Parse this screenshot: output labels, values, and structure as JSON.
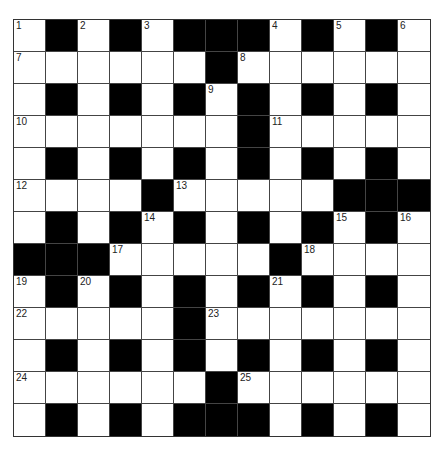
{
  "puzzle": {
    "rows": 13,
    "cols": 13,
    "colors": {
      "block": "#000000",
      "cell": "#ffffff",
      "line": "#444444"
    },
    "grid": [
      "W#W#W###W#W#W",
      "WWWWWW#WWWWWW",
      "W#W#W#W#W#W#W",
      "WWWWWWW#WWWWW",
      "W#W#W#W#W#W#W",
      "WWWW#WWWWW###",
      "W#W#W#W#W#W#W",
      "###WWWWW#WWWW",
      "W#W#W#W#W#W#W",
      "WWWWW#WWWWWWW",
      "W#W#W#W#W#W#W",
      "WWWWWW#WWWWWW",
      "W#W#W###W#W#W"
    ],
    "numbers": [
      {
        "n": "1",
        "r": 0,
        "c": 0
      },
      {
        "n": "2",
        "r": 0,
        "c": 2
      },
      {
        "n": "3",
        "r": 0,
        "c": 4
      },
      {
        "n": "4",
        "r": 0,
        "c": 8
      },
      {
        "n": "5",
        "r": 0,
        "c": 10
      },
      {
        "n": "6",
        "r": 0,
        "c": 12
      },
      {
        "n": "7",
        "r": 1,
        "c": 0
      },
      {
        "n": "8",
        "r": 1,
        "c": 7
      },
      {
        "n": "9",
        "r": 2,
        "c": 6
      },
      {
        "n": "10",
        "r": 3,
        "c": 0
      },
      {
        "n": "11",
        "r": 3,
        "c": 8
      },
      {
        "n": "12",
        "r": 5,
        "c": 0
      },
      {
        "n": "13",
        "r": 5,
        "c": 5
      },
      {
        "n": "14",
        "r": 6,
        "c": 4
      },
      {
        "n": "15",
        "r": 6,
        "c": 10
      },
      {
        "n": "16",
        "r": 6,
        "c": 12
      },
      {
        "n": "17",
        "r": 7,
        "c": 3
      },
      {
        "n": "18",
        "r": 7,
        "c": 9
      },
      {
        "n": "19",
        "r": 8,
        "c": 0
      },
      {
        "n": "20",
        "r": 8,
        "c": 2
      },
      {
        "n": "21",
        "r": 8,
        "c": 8
      },
      {
        "n": "22",
        "r": 9,
        "c": 0
      },
      {
        "n": "23",
        "r": 9,
        "c": 6
      },
      {
        "n": "24",
        "r": 11,
        "c": 0
      },
      {
        "n": "25",
        "r": 11,
        "c": 7
      }
    ]
  }
}
